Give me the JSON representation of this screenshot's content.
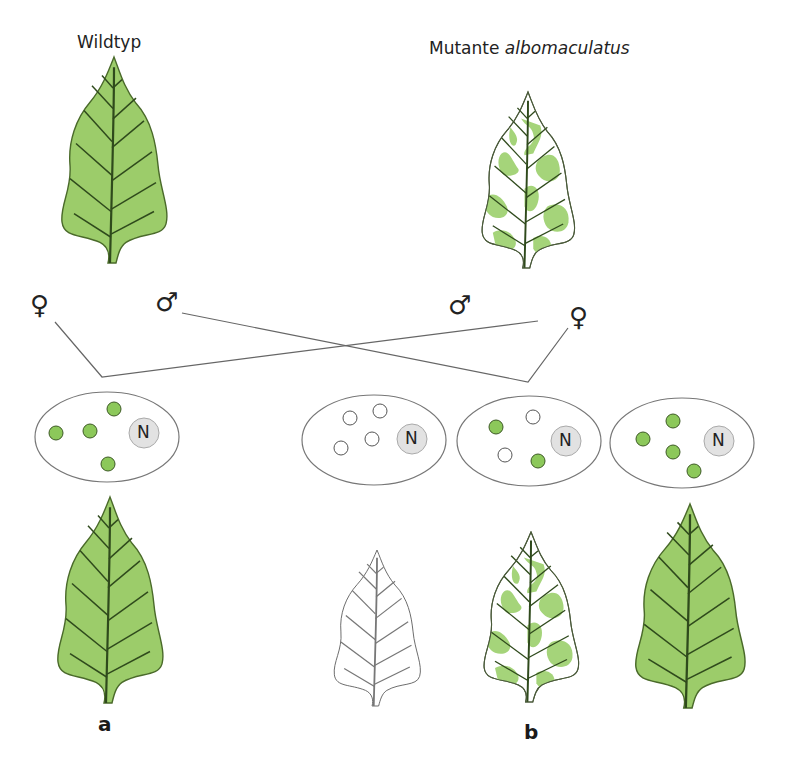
{
  "title_left": "Wildtyp",
  "title_right": {
    "plain": "Mutante ",
    "italic": "albomaculatus"
  },
  "panel_labels": {
    "a": "a",
    "b": "b"
  },
  "cross": {
    "left_female": "♀",
    "left_male": "♂",
    "right_male": "♂",
    "right_female": "♀"
  },
  "cells": [
    {
      "id": "cell-a",
      "nucleus": "N",
      "plastids": [
        "green",
        "green",
        "green",
        "green"
      ]
    },
    {
      "id": "cell-b1",
      "nucleus": "N",
      "plastids": [
        "white",
        "white",
        "white",
        "white"
      ]
    },
    {
      "id": "cell-b2",
      "nucleus": "N",
      "plastids": [
        "green",
        "white",
        "white",
        "green"
      ]
    },
    {
      "id": "cell-b3",
      "nucleus": "N",
      "plastids": [
        "green",
        "green",
        "green",
        "green"
      ]
    }
  ],
  "leaves": [
    {
      "id": "parent-wildtype",
      "type": "green"
    },
    {
      "id": "parent-mutant",
      "type": "variegated"
    },
    {
      "id": "offspring-a",
      "type": "green"
    },
    {
      "id": "offspring-b-white",
      "type": "white"
    },
    {
      "id": "offspring-b-variegated",
      "type": "variegated"
    },
    {
      "id": "offspring-b-green",
      "type": "green"
    }
  ],
  "colors": {
    "leaf_green": "#9ccc6a",
    "leaf_outline": "#4a6a2a",
    "vein": "#2f4a1c",
    "plastid_green": "#8cc85a",
    "nucleus_fill": "#e2e2e2",
    "line": "#666666"
  }
}
